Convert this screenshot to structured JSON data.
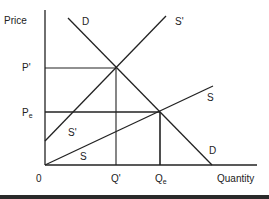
{
  "diagram": {
    "type": "supply-demand",
    "axes": {
      "y_label": "Price",
      "x_label": "Quantity",
      "origin_label": "0",
      "color": "#222222"
    },
    "price_labels": {
      "p_prime": "P'",
      "p_e_main": "P",
      "p_e_sub": "e"
    },
    "quantity_labels": {
      "q_prime": "Q'",
      "q_e_main": "Q",
      "q_e_sub": "e"
    },
    "curves": [
      {
        "id": "D",
        "label_top": "D",
        "label_bottom": "D",
        "from": [
          68,
          18
        ],
        "to": [
          212,
          165
        ]
      },
      {
        "id": "S_prime",
        "label_top": "S'",
        "label_bottom": "S'",
        "from": [
          45,
          141
        ],
        "to": [
          166,
          16
        ]
      },
      {
        "id": "S",
        "label_top": "S",
        "label_bottom": "S",
        "from": [
          45,
          165
        ],
        "to": [
          213,
          86
        ]
      }
    ],
    "equilibria": [
      {
        "name": "new",
        "price": "P'",
        "quantity": "Q'",
        "point": [
          116,
          68
        ]
      },
      {
        "name": "original",
        "price": "Pe",
        "quantity": "Qe",
        "point": [
          160,
          112
        ]
      }
    ],
    "line_color": "#222222"
  }
}
